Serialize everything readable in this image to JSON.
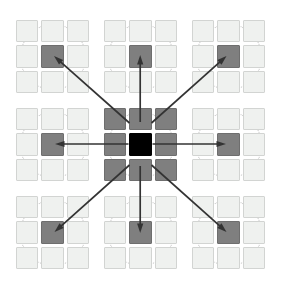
{
  "figure": {
    "colors": {
      "background": "#ffffff",
      "cell_light": "#eff1ef",
      "cell_light_border": "#d2d4d2",
      "cell_shaded": "#7f7f7f",
      "cell_shaded_border": "#6e6e6e",
      "cell_center_black": "#000000",
      "circle_dotted": "#b9b9b9",
      "arrow": "#333333"
    },
    "geometry": {
      "canvas_width": 281,
      "canvas_height": 295,
      "super_grid": 3,
      "block_grid": 3,
      "block_size": 73,
      "cell_size": 22.4,
      "cell_step": 25.3,
      "block_origin_x": [
        16,
        104,
        192
      ],
      "block_origin_y": [
        20,
        108,
        196
      ],
      "circle_diameter": 66
    }
  },
  "blocks": [
    {
      "id": "block-top-left",
      "name": "top-left",
      "col": 0,
      "row": 0,
      "shaded_cells": [
        4
      ],
      "black_cells": [],
      "has_circle": true
    },
    {
      "id": "block-top-center",
      "name": "top-center",
      "col": 1,
      "row": 0,
      "shaded_cells": [
        4
      ],
      "black_cells": [],
      "has_circle": true
    },
    {
      "id": "block-top-right",
      "name": "top-right",
      "col": 2,
      "row": 0,
      "shaded_cells": [
        4
      ],
      "black_cells": [],
      "has_circle": true
    },
    {
      "id": "block-middle-left",
      "name": "middle-left",
      "col": 0,
      "row": 1,
      "shaded_cells": [
        4
      ],
      "black_cells": [],
      "has_circle": true
    },
    {
      "id": "block-center",
      "name": "center",
      "col": 1,
      "row": 1,
      "shaded_cells": [
        0,
        1,
        2,
        3,
        5,
        6,
        7,
        8
      ],
      "black_cells": [
        4
      ],
      "has_circle": true
    },
    {
      "id": "block-middle-right",
      "name": "middle-right",
      "col": 2,
      "row": 1,
      "shaded_cells": [
        4
      ],
      "black_cells": [],
      "has_circle": true
    },
    {
      "id": "block-bottom-left",
      "name": "bottom-left",
      "col": 0,
      "row": 2,
      "shaded_cells": [
        4
      ],
      "black_cells": [],
      "has_circle": true
    },
    {
      "id": "block-bottom-center",
      "name": "bottom-center",
      "col": 1,
      "row": 2,
      "shaded_cells": [
        4
      ],
      "black_cells": [],
      "has_circle": true
    },
    {
      "id": "block-bottom-right",
      "name": "bottom-right",
      "col": 2,
      "row": 2,
      "shaded_cells": [
        4
      ],
      "black_cells": [],
      "has_circle": true
    }
  ],
  "arrows": [
    {
      "id": "arrow-to-top-left",
      "from_block": "center",
      "from_cell": 0,
      "to_block": "top-left",
      "to_cell": 4,
      "x1": 129.5,
      "y1": 123.0,
      "x2": 54.0,
      "y2": 56.0
    },
    {
      "id": "arrow-to-top-center",
      "from_block": "center",
      "from_cell": 1,
      "to_block": "top-center",
      "to_cell": 4,
      "x1": 140.2,
      "y1": 122.0,
      "x2": 140.2,
      "y2": 55.0
    },
    {
      "id": "arrow-to-top-right",
      "from_block": "center",
      "from_cell": 2,
      "to_block": "top-right",
      "to_cell": 4,
      "x1": 151.5,
      "y1": 123.0,
      "x2": 226.5,
      "y2": 56.0
    },
    {
      "id": "arrow-to-middle-left",
      "from_block": "center",
      "from_cell": 3,
      "to_block": "middle-left",
      "to_cell": 4,
      "x1": 128.5,
      "y1": 144.0,
      "x2": 55.0,
      "y2": 144.0
    },
    {
      "id": "arrow-to-middle-right",
      "from_block": "center",
      "from_cell": 5,
      "to_block": "middle-right",
      "to_cell": 4,
      "x1": 152.5,
      "y1": 144.0,
      "x2": 226.0,
      "y2": 144.0
    },
    {
      "id": "arrow-to-bottom-left",
      "from_block": "center",
      "from_cell": 6,
      "to_block": "bottom-left",
      "to_cell": 4,
      "x1": 129.5,
      "y1": 165.0,
      "x2": 54.5,
      "y2": 232.0
    },
    {
      "id": "arrow-to-bottom-center",
      "from_block": "center",
      "from_cell": 7,
      "to_block": "bottom-center",
      "to_cell": 4,
      "x1": 140.2,
      "y1": 166.0,
      "x2": 140.2,
      "y2": 233.0
    },
    {
      "id": "arrow-to-bottom-right",
      "from_block": "center",
      "from_cell": 8,
      "to_block": "bottom-right",
      "to_cell": 4,
      "x1": 151.5,
      "y1": 165.0,
      "x2": 226.5,
      "y2": 232.0
    }
  ]
}
